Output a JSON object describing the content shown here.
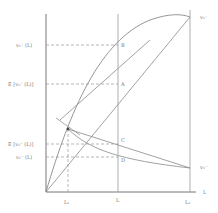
{
  "diagram": {
    "y_labels": {
      "vplus_L": "v₀⁺ (L)",
      "E_vplus_L": "E [v₀⁺ (L)]",
      "E_vminus_L": "E [v₀⁻ (L)]",
      "vminus_L": "v₀⁻ (L)"
    },
    "x_labels": {
      "L1": "L₁",
      "L": "L",
      "L2": "L₂",
      "axis": "L"
    },
    "curve_labels": {
      "vplus": "v₀⁺",
      "vminus": "v₀⁻"
    },
    "points": {
      "A": "A",
      "B": "B",
      "C": "C",
      "D": "D"
    },
    "colors": {
      "line": "#8a8a8a",
      "axis": "#777777",
      "text": "#777777"
    }
  }
}
